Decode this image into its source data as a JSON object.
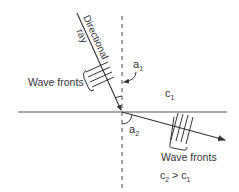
{
  "diagram": {
    "type": "refraction",
    "labels": {
      "directional_ray_line1": "Directional",
      "directional_ray_line2": "ray",
      "wave_fronts_incident": "Wave fronts",
      "wave_fronts_refracted": "Wave fronts",
      "angle_incident": "a",
      "angle_incident_sub": "1",
      "angle_refracted": "a",
      "angle_refracted_sub": "2",
      "medium1_speed": "c",
      "medium1_speed_sub": "1",
      "relation_c2": "c",
      "relation_c2_sub": "2",
      "relation_op": " > ",
      "relation_c1": "c",
      "relation_c1_sub": "1"
    },
    "colors": {
      "line": "#333333",
      "interface": "#555555",
      "text": "#333333",
      "background": "#ffffff"
    }
  }
}
